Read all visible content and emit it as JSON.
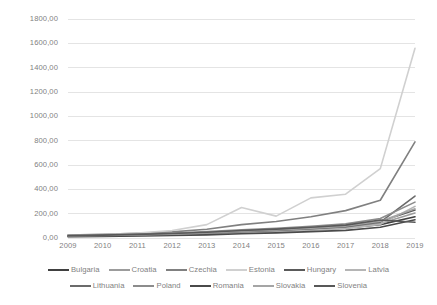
{
  "chart_data": {
    "type": "line",
    "title": "",
    "xlabel": "",
    "ylabel": "",
    "grid": "horizontal",
    "legend_position": "bottom",
    "ylim": [
      0,
      1800
    ],
    "ytick_step": 200,
    "ytick_labels": [
      "0,00",
      "200,00",
      "400,00",
      "600,00",
      "800,00",
      "1000,00",
      "1200,00",
      "1400,00",
      "1600,00",
      "1800,00"
    ],
    "ytick_values": [
      0,
      200,
      400,
      600,
      800,
      1000,
      1200,
      1400,
      1600,
      1800
    ],
    "categories": [
      "2009",
      "2010",
      "2011",
      "2012",
      "2013",
      "2014",
      "2015",
      "2016",
      "2017",
      "2018",
      "2019"
    ],
    "x": [
      2009,
      2010,
      2011,
      2012,
      2013,
      2014,
      2015,
      2016,
      2017,
      2018,
      2019
    ],
    "series": [
      {
        "name": "Bulgaria",
        "color": "#404040",
        "values": [
          18,
          22,
          27,
          33,
          41,
          52,
          60,
          70,
          82,
          110,
          175
        ]
      },
      {
        "name": "Croatia",
        "color": "#9c9c9c",
        "values": [
          14,
          17,
          21,
          26,
          34,
          46,
          55,
          68,
          84,
          120,
          205
        ]
      },
      {
        "name": "Czechia",
        "color": "#808080",
        "values": [
          25,
          31,
          39,
          50,
          72,
          110,
          135,
          175,
          225,
          310,
          790
        ]
      },
      {
        "name": "Estonia",
        "color": "#d0d0d0",
        "values": [
          20,
          28,
          40,
          62,
          110,
          250,
          180,
          330,
          360,
          570,
          1560
        ]
      },
      {
        "name": "Hungary",
        "color": "#5a5a5a",
        "values": [
          16,
          20,
          25,
          31,
          40,
          54,
          64,
          78,
          95,
          135,
          230
        ]
      },
      {
        "name": "Latvia",
        "color": "#b5b5b5",
        "values": [
          12,
          15,
          19,
          24,
          32,
          44,
          52,
          64,
          78,
          112,
          260
        ]
      },
      {
        "name": "Lithuania",
        "color": "#6b6b6b",
        "values": [
          15,
          19,
          24,
          30,
          39,
          52,
          62,
          76,
          92,
          130,
          345
        ]
      },
      {
        "name": "Poland",
        "color": "#8c8c8c",
        "values": [
          22,
          27,
          33,
          41,
          52,
          68,
          80,
          96,
          116,
          160,
          295
        ]
      },
      {
        "name": "Romania",
        "color": "#4a4a4a",
        "values": [
          10,
          13,
          16,
          20,
          26,
          35,
          42,
          52,
          63,
          88,
          150
        ]
      },
      {
        "name": "Slovakia",
        "color": "#a5a5a5",
        "values": [
          17,
          21,
          26,
          32,
          42,
          56,
          66,
          80,
          98,
          138,
          240
        ]
      },
      {
        "name": "Slovenia",
        "color": "#585858",
        "values": [
          19,
          24,
          30,
          37,
          47,
          62,
          73,
          88,
          106,
          148,
          130
        ]
      }
    ]
  },
  "legend": {
    "rows": [
      [
        "Bulgaria",
        "Croatia",
        "Czechia",
        "Estonia",
        "Hungary",
        "Latvia"
      ],
      [
        "Lithuania",
        "Poland",
        "Romania",
        "Slovakia",
        "Slovenia"
      ]
    ]
  }
}
